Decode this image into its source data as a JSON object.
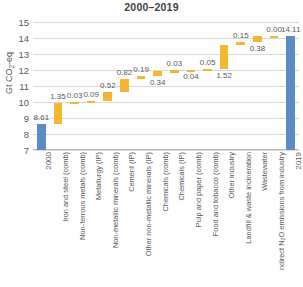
{
  "chart_data": {
    "type": "bar",
    "subtype": "waterfall",
    "title": "2000–2019",
    "xlabel": "",
    "ylabel": "Gt CO2-eq",
    "ylabel_rich": "Gt CO<sub>2</sub>-eq",
    "ylim": [
      7,
      15
    ],
    "yticks": [
      7,
      8,
      9,
      10,
      11,
      12,
      13,
      14,
      15
    ],
    "ytick_labels": [
      "7",
      "8",
      "9",
      "10",
      "11",
      "12",
      "13",
      "14",
      "15"
    ],
    "grid": true,
    "legend": "none",
    "baseline": 7,
    "categories": [
      "2000",
      "Iron and steel (comb)",
      "Non-ferrous metals (comb)",
      "Metallurgy (IP)",
      "Non-metallic minerals (comb)",
      "Cement (IP)",
      "Other non-metallic minerals (IP)",
      "Chemicals (comb)",
      "Chemicals (IP)",
      "Pulp and paper (comb)",
      "Food and tobacco (comb)",
      "Other industry",
      "Landfill & waste incineration",
      "Wastewater",
      "ndirect N2O emissions from industry",
      "2019"
    ],
    "category_labels_rich": [
      "2000",
      "Iron and steel (comb)",
      "Non-ferrous metals (comb)",
      "Metallurgy (IP)",
      "Non-metallic minerals (comb)",
      "Cement (IP)",
      "Other non-metallic minerals (IP)",
      "Chemicals (comb)",
      "Chemicals (IP)",
      "Pulp and paper (comb)",
      "Food and tobacco (comb)",
      "Other industry",
      "Landfill & waste incineration",
      "Wastewater",
      "ndirect N<sub>2</sub>O emissions from industry",
      "2019"
    ],
    "values": [
      8.61,
      1.35,
      0.03,
      0.09,
      0.52,
      0.82,
      0.19,
      0.34,
      0.03,
      0.04,
      0.05,
      1.52,
      0.15,
      0.38,
      0.0,
      14.11
    ],
    "value_labels": [
      "8.61",
      "1.35",
      "0.03",
      "0.09",
      "0.52",
      "0.82",
      "0.19",
      "0.34",
      "0.03",
      "0.04",
      "0.05",
      "1.52",
      "0.15",
      "0.38",
      "0.00",
      "14.11"
    ],
    "bar_kinds": [
      "total",
      "delta",
      "delta",
      "delta",
      "delta",
      "delta",
      "delta",
      "delta",
      "delta",
      "delta",
      "delta",
      "delta",
      "delta",
      "delta",
      "delta",
      "total"
    ],
    "bar_bottoms": [
      7.0,
      8.61,
      9.96,
      9.99,
      10.08,
      10.6,
      11.42,
      11.61,
      11.95,
      11.98,
      12.02,
      12.07,
      13.59,
      13.74,
      14.12,
      7.0
    ],
    "bar_tops": [
      8.61,
      9.96,
      9.99,
      10.08,
      10.6,
      11.42,
      11.61,
      11.95,
      11.98,
      12.02,
      12.07,
      13.59,
      13.74,
      14.12,
      14.12,
      14.11
    ],
    "label_anchor_y": [
      8.61,
      9.96,
      9.99,
      10.08,
      10.6,
      11.42,
      11.61,
      11.61,
      11.98,
      11.98,
      12.07,
      12.07,
      13.74,
      13.74,
      14.12,
      14.11
    ],
    "label_position": [
      "above",
      "above",
      "above",
      "above",
      "above",
      "above",
      "above",
      "below",
      "above",
      "below",
      "above",
      "below",
      "above",
      "below",
      "above",
      "above"
    ],
    "colors": {
      "total": "#5b8cc6",
      "delta": "#f5b731",
      "grid": "#d9d9d9",
      "text": "#595959",
      "title": "#3f3f3f",
      "background": "#ffffff"
    }
  }
}
